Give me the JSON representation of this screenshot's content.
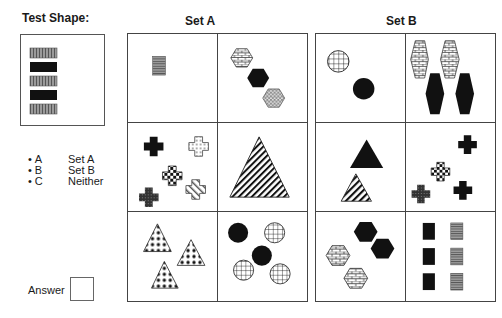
{
  "test_shape": {
    "label": "Test Shape:",
    "description": "Column of 5 horizontal rectangles alternating vertical-striped gray and solid black"
  },
  "set_a": {
    "title": "Set A",
    "cells": [
      {
        "id": "a1",
        "description": "One small horizontal-striped gray rectangle"
      },
      {
        "id": "a2",
        "description": "Three hexagons: brick, solid black, zigzag gray"
      },
      {
        "id": "a3",
        "description": "Four crosses: black, white dotted, checkered, dark dotted, diagonal white"
      },
      {
        "id": "a4",
        "description": "One large diagonal-striped triangle"
      },
      {
        "id": "a5",
        "description": "Three triangles with black dot pattern"
      },
      {
        "id": "a6",
        "description": "Two solid black circles and three grid-pattern circles"
      }
    ]
  },
  "set_b": {
    "title": "Set B",
    "cells": [
      {
        "id": "b1",
        "description": "One grid circle and one solid black circle"
      },
      {
        "id": "b2",
        "description": "Two tall brick hexagons and two tall solid black hexagons"
      },
      {
        "id": "b3",
        "description": "One solid black triangle above one diagonal-striped triangle"
      },
      {
        "id": "b4",
        "description": "Four crosses: two black, one checkered, one dark dotted"
      },
      {
        "id": "b5",
        "description": "Two solid black hexagons and two brick hexagons"
      },
      {
        "id": "b6",
        "description": "Three solid black rectangles and three horizontal-striped gray rectangles"
      }
    ]
  },
  "options": [
    {
      "key": "A",
      "label": "Set A"
    },
    {
      "key": "B",
      "label": "Set B"
    },
    {
      "key": "C",
      "label": "Neither"
    }
  ],
  "answer": {
    "label": "Answer",
    "value": ""
  },
  "colors": {
    "ink": "#111111",
    "border": "#444444",
    "gray_fill": "#8a8a8a"
  }
}
